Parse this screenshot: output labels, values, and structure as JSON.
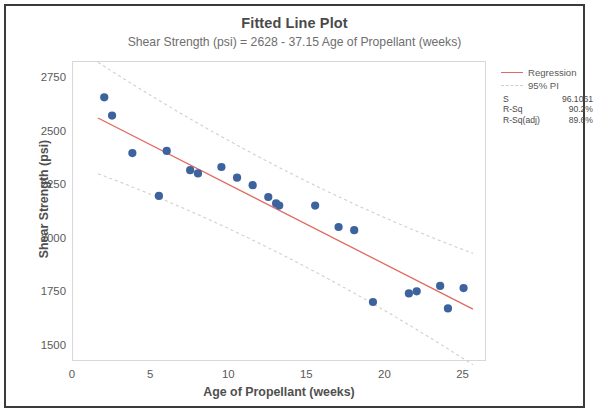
{
  "chart_data": {
    "type": "scatter",
    "title": "Fitted Line Plot",
    "subtitle": "Shear Strength (psi) = 2628 - 37.15 Age of Propellant (weeks)",
    "xlabel": "Age of Propellant (weeks)",
    "ylabel": "Shear Strength (psi)",
    "xlim": [
      0,
      26.5
    ],
    "ylim": [
      1430,
      2830
    ],
    "xticks": [
      0,
      5,
      10,
      15,
      20,
      25
    ],
    "yticks": [
      1500,
      1750,
      2000,
      2250,
      2500,
      2750
    ],
    "grid": false,
    "legend_position": "right",
    "x": [
      2.0,
      2.5,
      3.8,
      5.5,
      6.0,
      7.5,
      8.0,
      9.5,
      10.5,
      11.5,
      12.5,
      13.0,
      13.2,
      15.5,
      17.0,
      18.0,
      19.2,
      21.5,
      22.0,
      23.5,
      24.0,
      25.0
    ],
    "y": [
      2665,
      2580,
      2405,
      2205,
      2415,
      2325,
      2310,
      2340,
      2290,
      2255,
      2200,
      2170,
      2160,
      2160,
      2060,
      2045,
      1710,
      1750,
      1760,
      1785,
      1680,
      1775
    ],
    "fit": {
      "intercept": 2628,
      "slope": -37.15,
      "line_color": "#e0695f"
    },
    "prediction_interval": {
      "label": "95% PI",
      "level": 95,
      "color": "#cfcfcf",
      "half_width": 200
    },
    "marker_color": "#3c639e",
    "legend": [
      {
        "key": "regression",
        "label": "Regression"
      },
      {
        "key": "pi",
        "label": "95% PI"
      }
    ],
    "stats": [
      {
        "key": "S",
        "value": "96.1061"
      },
      {
        "key": "R-Sq",
        "value": "90.2%"
      },
      {
        "key": "R-Sq(adj)",
        "value": "89.6%"
      }
    ]
  }
}
